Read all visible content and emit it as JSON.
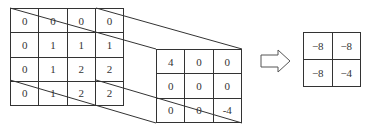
{
  "input_matrix": {
    "label": "input",
    "rows": [
      [
        "0",
        "0",
        "0",
        "0"
      ],
      [
        "0",
        "1",
        "1",
        "1"
      ],
      [
        "0",
        "1",
        "2",
        "2"
      ],
      [
        "0",
        "1",
        "2",
        "2"
      ]
    ]
  },
  "kernel_matrix": {
    "label": "kernel",
    "rows": [
      [
        "4",
        "0",
        "0"
      ],
      [
        "0",
        "0",
        "0"
      ],
      [
        "0",
        "0",
        "-4"
      ]
    ]
  },
  "output_matrix": {
    "label": "output",
    "rows": [
      [
        "−8",
        "−8"
      ],
      [
        "−8",
        "−4"
      ]
    ]
  },
  "arrow": {
    "icon": "right-arrow-icon"
  },
  "colors": {
    "line": "#333333",
    "background": "#ffffff"
  }
}
